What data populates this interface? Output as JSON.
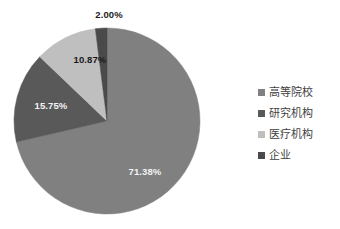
{
  "chart_data": {
    "type": "pie",
    "title": "",
    "subtitle": "",
    "xlabel": "",
    "ylabel": "",
    "grid": false,
    "legend_position": "right",
    "units": "percent",
    "start_angle_deg": 0,
    "direction": "clockwise",
    "categories": [
      "高等院校",
      "研究机构",
      "医疗机构",
      "企业"
    ],
    "values": [
      71.38,
      15.75,
      10.87,
      2.0
    ],
    "slices": [
      {
        "label": "高等院校",
        "value": 71.38,
        "value_text": "71.38%",
        "color": "#808080",
        "label_x": 145,
        "label_y": 172,
        "label_on_dark": true
      },
      {
        "label": "研究机构",
        "value": 15.75,
        "value_text": "15.75%",
        "color": "#595959",
        "label_x": 51,
        "label_y": 106,
        "label_on_dark": true
      },
      {
        "label": "医疗机构",
        "value": 10.87,
        "value_text": "10.87%",
        "color": "#bfbfbf",
        "label_x": 90,
        "label_y": 60,
        "label_on_dark": false
      },
      {
        "label": "企业",
        "value": 2.0,
        "value_text": "2.00%",
        "color": "#4a4a4a",
        "label_x": 109,
        "label_y": 15,
        "label_on_dark": false
      }
    ],
    "geometry": {
      "center_x": 107,
      "center_y": 121,
      "radius": 93
    }
  },
  "legend": {
    "items": [
      {
        "label": "高等院校",
        "color": "#808080"
      },
      {
        "label": "研究机构",
        "color": "#595959"
      },
      {
        "label": "医疗机构",
        "color": "#bfbfbf"
      },
      {
        "label": "企业",
        "color": "#4a4a4a"
      }
    ]
  }
}
